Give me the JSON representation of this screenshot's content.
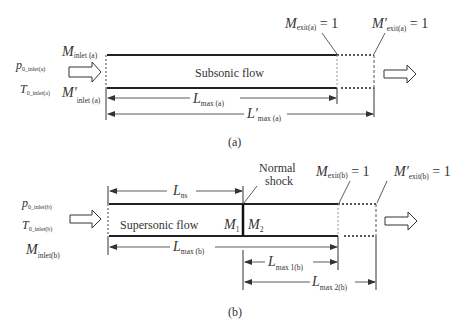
{
  "diagram_a": {
    "caption": "(a)",
    "flow_label": "Subsonic flow",
    "inlet_labels": {
      "p0": {
        "main": "p",
        "sub": "0_inlet(a)"
      },
      "t0": {
        "main": "T",
        "sub": "0_inlet(a)"
      }
    },
    "m_inlet": {
      "main": "M",
      "sub": "inlet (a)"
    },
    "m_inlet_prime": {
      "main": "M′",
      "sub": "inlet (a)"
    },
    "m_exit": {
      "main": "M",
      "sub": "exit(a)",
      "eq": " = 1"
    },
    "m_exit_prime": {
      "main": "M′",
      "sub": "exit(a)",
      "eq": " = 1"
    },
    "l_max": {
      "main": "L",
      "sub": "max (a)"
    },
    "l_max_prime": {
      "main": "L′",
      "sub": "max (a)"
    }
  },
  "diagram_b": {
    "caption": "(b)",
    "flow_label": "Supersonic flow",
    "inlet_labels": {
      "p0": {
        "main": "p",
        "sub": "0_inlet(b)"
      },
      "t0": {
        "main": "T",
        "sub": "0_inlet(b)"
      },
      "m": {
        "main": "M",
        "sub": "inlet(b)"
      }
    },
    "shock_label_1": "Normal",
    "shock_label_2": "shock",
    "m1": {
      "main": "M",
      "sub": "1"
    },
    "m2": {
      "main": "M",
      "sub": "2"
    },
    "m_exit": {
      "main": "M",
      "sub": "exit(b)",
      "eq": " = 1"
    },
    "m_exit_prime": {
      "main": "M′",
      "sub": "exit(b)",
      "eq": " = 1"
    },
    "l_ns": {
      "main": "L",
      "sub": "ns"
    },
    "l_max": {
      "main": "L",
      "sub": "max (b)"
    },
    "l_max1": {
      "main": "L",
      "sub": "max 1(b)"
    },
    "l_max2": {
      "main": "L",
      "sub": "max 2(b)"
    }
  }
}
